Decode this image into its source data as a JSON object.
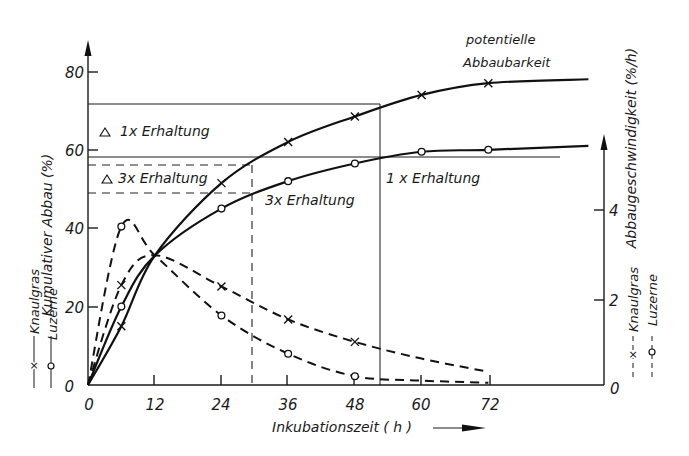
{
  "chart_data": {
    "type": "line",
    "title": "",
    "xlabel": "Inkubationszeit ( h )",
    "ylabel_left": "Kumulativer Abbau (%)",
    "ylabel_right": "Abbaugeschwindigkeit (%/h)",
    "x_ticks": [
      0,
      12,
      24,
      36,
      48,
      60,
      72
    ],
    "y_left_ticks": [
      0,
      20,
      40,
      60,
      80
    ],
    "y_right_ticks": [
      0,
      2,
      4
    ],
    "xlim": [
      0,
      90
    ],
    "ylim_left": [
      0,
      85
    ],
    "ylim_right": [
      0,
      4.8
    ],
    "grid": false,
    "series": [
      {
        "name": "Knaulgras – kumulativer Abbau",
        "axis": "left",
        "style": "solid",
        "marker": "x",
        "x": [
          0,
          6,
          12,
          24,
          36,
          48,
          60,
          72,
          90
        ],
        "y": [
          0,
          15,
          33,
          51.5,
          62,
          68.5,
          74,
          77,
          78
        ],
        "markers_at": [
          6,
          24,
          36,
          48,
          60,
          72
        ]
      },
      {
        "name": "Luzerne – kumulativer Abbau",
        "axis": "left",
        "style": "solid",
        "marker": "o",
        "x": [
          0,
          6,
          12,
          24,
          36,
          48,
          60,
          72,
          90
        ],
        "y": [
          0,
          20,
          33,
          45,
          52,
          56.5,
          59.5,
          60,
          61
        ],
        "markers_at": [
          6,
          24,
          36,
          48,
          60,
          72
        ]
      },
      {
        "name": "Knaulgras – Abbaugeschwindigkeit",
        "axis": "right",
        "style": "dashed",
        "marker": "x",
        "x": [
          0,
          6,
          12,
          24,
          36,
          48,
          60,
          72
        ],
        "y": [
          0,
          2.27,
          2.95,
          2.24,
          1.49,
          0.98,
          0.6,
          0.3
        ],
        "markers_at": [
          6,
          24,
          36,
          48
        ]
      },
      {
        "name": "Luzerne – Abbaugeschwindigkeit",
        "axis": "right",
        "style": "dashed",
        "marker": "o",
        "x": [
          0,
          6,
          12,
          24,
          36,
          48,
          60,
          72
        ],
        "y": [
          0,
          3.6,
          2.95,
          1.58,
          0.71,
          0.2,
          0.1,
          0.05
        ],
        "markers_at": [
          6,
          24,
          36,
          48
        ]
      }
    ],
    "reference_lines": [
      {
        "label": "△ 1x Erhaltung",
        "type": "horizontal",
        "style": "solid",
        "y": 71.5,
        "x_end": 52.5
      },
      {
        "label": "1x Erhaltung (Luzerne)",
        "type": "horizontal",
        "style": "solid",
        "y": 58.2,
        "x_end": 90
      },
      {
        "label": "△ 3x Erhaltung (upper)",
        "type": "horizontal",
        "style": "dashed",
        "y": 56.2,
        "x_end": 29.5
      },
      {
        "label": "△ 3x Erhaltung (lower)",
        "type": "horizontal",
        "style": "dashed",
        "y": 49,
        "x_end": 29.5
      },
      {
        "label": "1x Erhaltung time",
        "type": "vertical",
        "style": "solid",
        "x": 52.5
      },
      {
        "label": "3x Erhaltung time",
        "type": "vertical",
        "style": "dashed",
        "x": 29.5
      }
    ],
    "annotations": [
      {
        "text": "potentielle",
        "pos": "top-right"
      },
      {
        "text": "Abbaubarkeit",
        "pos": "top-right"
      },
      {
        "text": "△  1x Erhaltung",
        "pos": "upper-left box"
      },
      {
        "text": "△  3x Erhaltung",
        "pos": "dashed box"
      },
      {
        "text": "3x Erhaltung",
        "pos": "below Luzerne curve"
      },
      {
        "text": "1x Erhaltung",
        "pos": "below Luzerne plateau"
      }
    ],
    "legend": {
      "left": [
        {
          "symbol": "—×—",
          "label": "Knaulgras"
        },
        {
          "symbol": "—○—",
          "label": "Luzerne"
        }
      ],
      "right": [
        {
          "symbol": "--×--",
          "label": "Knaulgras"
        },
        {
          "symbol": "--○--",
          "label": "Luzerne"
        }
      ]
    }
  },
  "labels": {
    "y_left": "Kumulativer  Abbau  (%)",
    "y_right": "Abbaugeschwindigkeit  (%/h)",
    "x_axis": "Inkubationszeit   ( h )",
    "potentielle": "potentielle",
    "abbaubarkeit": "Abbaubarkeit",
    "box1": "1x Erhaltung",
    "box3": "3x Erhaltung",
    "mid3": "3x Erhaltung",
    "right1": "1 x Erhaltung",
    "legend_knaulgras": "Knaulgras",
    "legend_luzerne": "Luzerne",
    "xtick": [
      "0",
      "12",
      "24",
      "36",
      "48",
      "60",
      "72"
    ],
    "ytick_left": [
      "0",
      "20",
      "40",
      "60",
      "80"
    ],
    "ytick_right": [
      "0",
      "2",
      "4"
    ]
  }
}
